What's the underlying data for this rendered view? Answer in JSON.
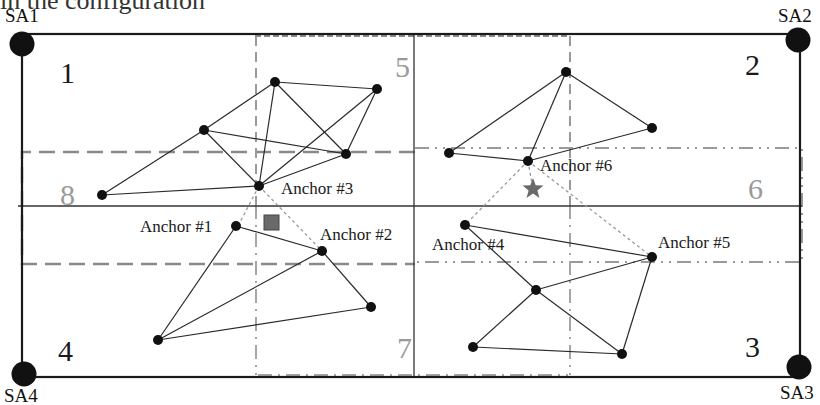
{
  "header": {
    "cut_text": "in the configuration"
  },
  "colors": {
    "line": "#2a2a2a",
    "node": "#111111",
    "dashed_gray": "#8a8a8a",
    "dotted_link": "#9a9a9a",
    "target_star": "#6a6a6a",
    "estimate_square": "#6a6a6a",
    "gray_region_label": "#9a9a9a"
  },
  "boundary": {
    "x": 18,
    "y": 33,
    "width": 782,
    "height": 335
  },
  "sensor_anchors": [
    {
      "id": "SA1",
      "label": "SA1",
      "x": 22,
      "y": 44,
      "label_x": 5,
      "label_y": 6
    },
    {
      "id": "SA2",
      "label": "SA2",
      "x": 798,
      "y": 40,
      "label_x": 778,
      "label_y": 6
    },
    {
      "id": "SA3",
      "label": "SA3",
      "x": 799,
      "y": 367,
      "label_x": 780,
      "label_y": 383
    },
    {
      "id": "SA4",
      "label": "SA4",
      "x": 24,
      "y": 374,
      "label_x": 4,
      "label_y": 386
    }
  ],
  "regions": [
    {
      "label": "1",
      "x": 60,
      "y": 58,
      "gray": false
    },
    {
      "label": "2",
      "x": 745,
      "y": 50,
      "gray": false
    },
    {
      "label": "3",
      "x": 745,
      "y": 332,
      "gray": false
    },
    {
      "label": "4",
      "x": 58,
      "y": 336,
      "gray": false
    },
    {
      "label": "5",
      "x": 395,
      "y": 52,
      "gray": true
    },
    {
      "label": "6",
      "x": 748,
      "y": 174,
      "gray": true
    },
    {
      "label": "7",
      "x": 397,
      "y": 333,
      "gray": true
    },
    {
      "label": "8",
      "x": 60,
      "y": 180,
      "gray": true
    }
  ],
  "anchor_labels": [
    {
      "text": "Anchor #1",
      "x": 140,
      "y": 218
    },
    {
      "text": "Anchor #2",
      "x": 320,
      "y": 226
    },
    {
      "text": "Anchor #3",
      "x": 281,
      "y": 180
    },
    {
      "text": "Anchor #4",
      "x": 432,
      "y": 236
    },
    {
      "text": "Anchor #5",
      "x": 658,
      "y": 234
    },
    {
      "text": "Anchor #6",
      "x": 540,
      "y": 157
    }
  ],
  "clusters": [
    {
      "name": "top-left",
      "nodes": [
        [
          275,
          82
        ],
        [
          377,
          89
        ],
        [
          204,
          130
        ],
        [
          346,
          154
        ],
        [
          259,
          186
        ],
        [
          102,
          195
        ]
      ],
      "edges": [
        [
          0,
          1
        ],
        [
          0,
          2
        ],
        [
          0,
          4
        ],
        [
          0,
          3
        ],
        [
          1,
          4
        ],
        [
          1,
          3
        ],
        [
          2,
          4
        ],
        [
          2,
          3
        ],
        [
          2,
          5
        ],
        [
          5,
          4
        ],
        [
          4,
          3
        ]
      ]
    },
    {
      "name": "bottom-left",
      "nodes": [
        [
          236,
          226
        ],
        [
          322,
          251
        ],
        [
          371,
          307
        ],
        [
          158,
          340
        ]
      ],
      "edges": [
        [
          0,
          1
        ],
        [
          0,
          3
        ],
        [
          1,
          3
        ],
        [
          1,
          2
        ],
        [
          3,
          2
        ]
      ]
    },
    {
      "name": "top-right",
      "nodes": [
        [
          566,
          72
        ],
        [
          652,
          128
        ],
        [
          449,
          153
        ],
        [
          528,
          161
        ]
      ],
      "edges": [
        [
          0,
          2
        ],
        [
          0,
          3
        ],
        [
          0,
          1
        ],
        [
          2,
          3
        ],
        [
          3,
          1
        ]
      ]
    },
    {
      "name": "bottom-right",
      "nodes": [
        [
          465,
          225
        ],
        [
          652,
          257
        ],
        [
          536,
          290
        ],
        [
          473,
          347
        ],
        [
          622,
          354
        ]
      ],
      "edges": [
        [
          0,
          1
        ],
        [
          0,
          2
        ],
        [
          2,
          1
        ],
        [
          2,
          4
        ],
        [
          2,
          3
        ],
        [
          3,
          4
        ],
        [
          1,
          4
        ]
      ]
    }
  ],
  "dotted_links": [
    [
      [
        259,
        186
      ],
      [
        238,
        226
      ]
    ],
    [
      [
        259,
        186
      ],
      [
        322,
        251
      ]
    ],
    [
      [
        528,
        161
      ],
      [
        465,
        225
      ]
    ],
    [
      [
        528,
        161
      ],
      [
        652,
        257
      ]
    ],
    [
      [
        528,
        161
      ],
      [
        533,
        189
      ]
    ]
  ],
  "markers": {
    "star": {
      "x": 533,
      "y": 189
    },
    "square": {
      "x": 264,
      "y": 215,
      "size": 15
    }
  }
}
